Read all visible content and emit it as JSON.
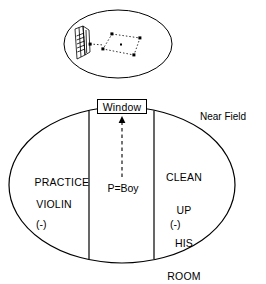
{
  "figure": {
    "stroke_color": "#000000",
    "background_color": "#ffffff"
  },
  "inset": {
    "name": "upper-perspective-ellipse",
    "shape": "ellipse",
    "contents": [
      {
        "name": "window-drawing",
        "label": ""
      },
      {
        "name": "dotted-region-quadrilateral",
        "label": ""
      }
    ]
  },
  "main": {
    "ellipse": {
      "name": "near-field-ellipse"
    },
    "window": {
      "label": "Window"
    },
    "near_field": {
      "label": "Near Field"
    },
    "person": {
      "label": "P=Boy"
    },
    "arrow": {
      "name": "dashed-arrow-up",
      "direction": "up",
      "style": "dashed"
    },
    "regions": [
      {
        "name": "region-left",
        "lines": [
          "PRACTICE",
          "VIOLIN"
        ],
        "line1": "PRACTICE",
        "line2": "VIOLIN",
        "valence": "(-)"
      },
      {
        "name": "region-center",
        "lines": [
          "P=Boy"
        ],
        "valence": ""
      },
      {
        "name": "region-right",
        "lines": [
          "CLEAN",
          "UP",
          "HIS",
          "ROOM"
        ],
        "line1": "CLEAN",
        "line2": "UP",
        "line3": "HIS",
        "line4": "ROOM",
        "valence": "(-)"
      }
    ]
  }
}
